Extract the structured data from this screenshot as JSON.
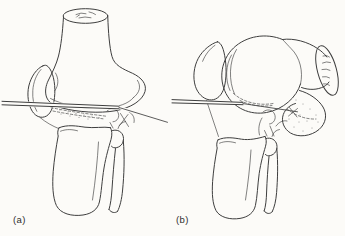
{
  "figure": {
    "kind": "medical-line-illustration",
    "background_color": "#fcfbf8",
    "line_color": "#3e3e3e",
    "label_color": "#2d2d2d",
    "panels": [
      {
        "label": "(a)",
        "name": "knee-extended",
        "parts": [
          "femur",
          "patella",
          "tibia",
          "fibula",
          "transfixing-wire",
          "meniscus-dashed-band"
        ]
      },
      {
        "label": "(b)",
        "name": "knee-flexed",
        "parts": [
          "femur",
          "femoral-condyle",
          "patella",
          "tibia",
          "fibula",
          "transfixing-wire",
          "posterior-capsule-flap"
        ]
      }
    ]
  }
}
